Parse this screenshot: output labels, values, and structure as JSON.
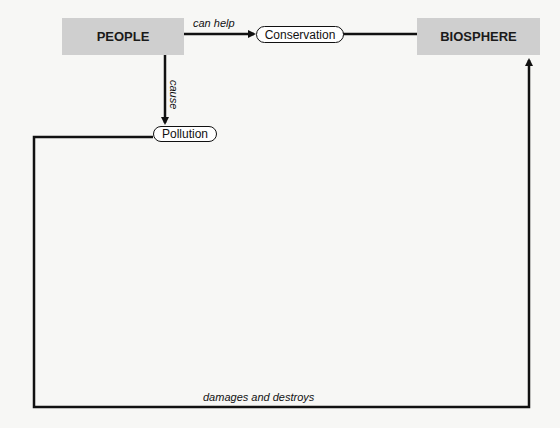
{
  "nodes": {
    "people": "PEOPLE",
    "biosphere": "BIOSPHERE",
    "conservation": "Conservation",
    "pollution": "Pollution"
  },
  "edges": {
    "people_to_conservation": "can help",
    "people_to_pollution": "cause",
    "pollution_to_biosphere": "damages and destroys"
  },
  "colors": {
    "box_fill": "#cfcfcf",
    "line": "#111111"
  }
}
